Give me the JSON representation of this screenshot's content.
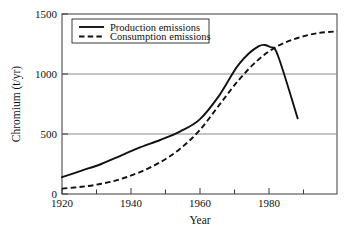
{
  "chart_data": {
    "type": "line",
    "title": "",
    "xlabel": "Year",
    "ylabel": "Chromium (t/yr)",
    "xlim": [
      1920,
      1990
    ],
    "ylim": [
      0,
      1500
    ],
    "xticks": [
      1920,
      1940,
      1960,
      1980
    ],
    "xtick_labels": [
      "1920",
      "1940",
      "1960",
      "1980"
    ],
    "xminor_ticks": [
      1930,
      1950,
      1970,
      1990
    ],
    "yticks": [
      0,
      500,
      1000,
      1500
    ],
    "ytick_labels": [
      "0",
      "500",
      "1000",
      "1500"
    ],
    "grid": "horizontal gridlines at 500 and 1000",
    "legend_position": "top-left inside plot area",
    "series": [
      {
        "name": "Production emissions",
        "style": "solid",
        "color": "#111111",
        "x": [
          1920,
          1925,
          1930,
          1935,
          1940,
          1945,
          1950,
          1955,
          1960,
          1965,
          1970,
          1973,
          1975,
          1980
        ],
        "values": [
          140,
          195,
          250,
          320,
          390,
          450,
          520,
          620,
          820,
          1080,
          1230,
          1225,
          1150,
          630
        ]
      },
      {
        "name": "Consumption emissions",
        "style": "dashed",
        "color": "#111111",
        "x": [
          1920,
          1925,
          1930,
          1935,
          1940,
          1945,
          1950,
          1955,
          1960,
          1965,
          1970,
          1975,
          1980,
          1985,
          1990
        ],
        "values": [
          45,
          60,
          85,
          125,
          185,
          265,
          375,
          530,
          740,
          950,
          1120,
          1235,
          1300,
          1340,
          1355
        ]
      }
    ]
  },
  "legend": {
    "entries": [
      {
        "label": "Production emissions"
      },
      {
        "label": "Consumption emissions"
      }
    ]
  },
  "axes": {
    "y_title": "Chromium (t/yr)",
    "x_title": "Year",
    "y_labels": [
      "1500",
      "1000",
      "500",
      "0"
    ],
    "x_labels": [
      "1920",
      "1940",
      "1960",
      "1980"
    ]
  }
}
